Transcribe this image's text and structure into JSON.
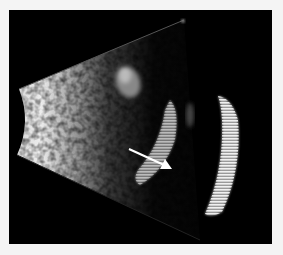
{
  "image": {
    "type": "ultrasound B-scan",
    "background_color": "#f4f4f4",
    "frame_color": "#000000",
    "annotations": [
      {
        "kind": "arrow",
        "color": "#ffffff",
        "from": [
          129,
          149
        ],
        "to": [
          172,
          169
        ],
        "direction": "down-right"
      }
    ],
    "regions": [
      {
        "name": "fan-beam-sector",
        "description": "bright sector emanating from left edge"
      },
      {
        "name": "upper-echo-blob",
        "description": "moderate echo upper-middle"
      },
      {
        "name": "inner-membrane-arc",
        "description": "curved echogenic band near arrow"
      },
      {
        "name": "posterior-wall-arc",
        "description": "bright striated curved band on right"
      }
    ]
  }
}
